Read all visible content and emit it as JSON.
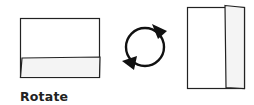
{
  "caption": "Rotate",
  "figures": {
    "before": {
      "description": "landscape sheet with bottom fold"
    },
    "action": {
      "icon": "rotate-cycle-icon"
    },
    "after": {
      "description": "portrait sheet with right fold"
    }
  },
  "colors": {
    "stroke": "#222222",
    "panel_fill": "#f4f4f4",
    "background": "#ffffff"
  }
}
